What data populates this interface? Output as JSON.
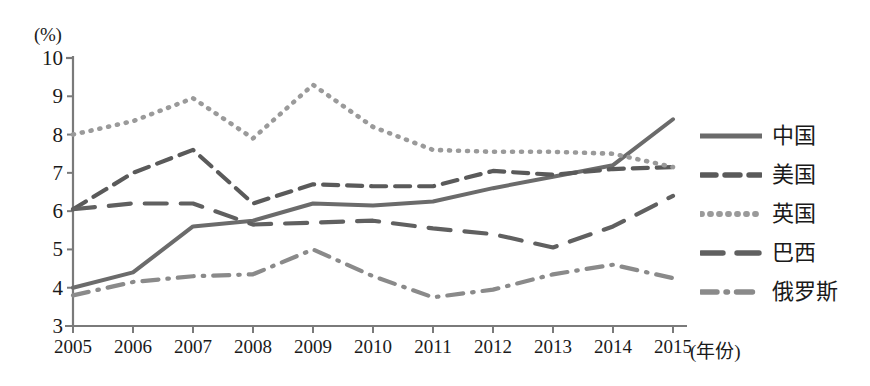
{
  "chart_data": {
    "type": "line",
    "title": "",
    "subtitle": "",
    "xlabel": "(年份)",
    "ylabel": "(%)",
    "x": [
      2005,
      2006,
      2007,
      2008,
      2009,
      2010,
      2011,
      2012,
      2013,
      2014,
      2015
    ],
    "categories": [
      "2005",
      "2006",
      "2007",
      "2008",
      "2009",
      "2010",
      "2011",
      "2012",
      "2013",
      "2014",
      "2015"
    ],
    "xlim": [
      2005,
      2015
    ],
    "ylim": [
      3,
      10
    ],
    "y_ticks": [
      "3",
      "4",
      "5",
      "6",
      "7",
      "8",
      "9",
      "10"
    ],
    "grid": false,
    "legend_position": "right",
    "series": [
      {
        "name": "中国",
        "style": "solid",
        "color": "#6b6b6b",
        "values": [
          4.0,
          4.4,
          5.6,
          5.75,
          6.2,
          6.15,
          6.25,
          6.6,
          6.9,
          7.2,
          8.4
        ]
      },
      {
        "name": "美国",
        "style": "dashed",
        "color": "#5a5a5a",
        "values": [
          6.05,
          7.0,
          7.6,
          6.2,
          6.7,
          6.65,
          6.65,
          7.05,
          6.95,
          7.1,
          7.15
        ]
      },
      {
        "name": "英国",
        "style": "dotted",
        "color": "#9a9a9a",
        "values": [
          8.0,
          8.35,
          8.95,
          7.9,
          9.3,
          8.2,
          7.6,
          7.55,
          7.55,
          7.5,
          7.15
        ]
      },
      {
        "name": "巴西",
        "style": "longdash",
        "color": "#606060",
        "values": [
          6.05,
          6.2,
          6.2,
          5.65,
          5.7,
          5.75,
          5.55,
          5.4,
          5.05,
          5.6,
          6.4
        ]
      },
      {
        "name": "俄罗斯",
        "style": "dashdot",
        "color": "#8a8a8a",
        "values": [
          3.8,
          4.15,
          4.3,
          4.35,
          5.0,
          4.3,
          3.75,
          3.95,
          4.35,
          4.6,
          4.25
        ]
      }
    ]
  },
  "axes": {
    "y_unit": "(%)",
    "x_unit": "(年份)",
    "y_tick_labels": [
      "10",
      "9",
      "8",
      "7",
      "6",
      "5",
      "4",
      "3"
    ],
    "x_tick_labels": [
      "2005",
      "2006",
      "2007",
      "2008",
      "2009",
      "2010",
      "2011",
      "2012",
      "2013",
      "2014",
      "2015"
    ]
  },
  "legend": {
    "items": [
      {
        "label": "中国",
        "style": "solid"
      },
      {
        "label": "美国",
        "style": "dashed"
      },
      {
        "label": "英国",
        "style": "dotted"
      },
      {
        "label": "巴西",
        "style": "longdash"
      },
      {
        "label": "俄罗斯",
        "style": "dashdot"
      }
    ]
  },
  "colors": {
    "axis": "#7a7a7a",
    "text": "#1a1a1a",
    "background": "#ffffff",
    "series_china": "#6b6b6b",
    "series_usa": "#5a5a5a",
    "series_uk": "#9a9a9a",
    "series_brazil": "#606060",
    "series_russia": "#8a8a8a"
  }
}
